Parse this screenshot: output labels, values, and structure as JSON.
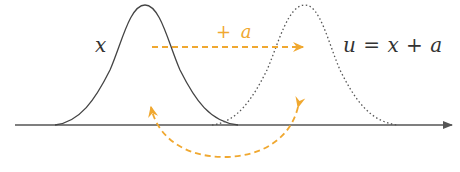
{
  "diagram": {
    "labels": {
      "original": "x",
      "shift": "+ a",
      "shift_sign": "+",
      "shift_var": "a",
      "transformed_u": "u",
      "transformed_eq": "=",
      "transformed_x": "x",
      "transformed_plus": "+",
      "transformed_a": "a",
      "transformed_full": "u = x + a"
    },
    "colors": {
      "curve": "#444444",
      "axis": "#555555",
      "accent": "#f0a830",
      "text": "#333333"
    },
    "curves": [
      {
        "name": "original-distribution",
        "style": "solid",
        "peak_x": 145
      },
      {
        "name": "shifted-distribution",
        "style": "dotted",
        "peak_x": 305
      }
    ]
  }
}
